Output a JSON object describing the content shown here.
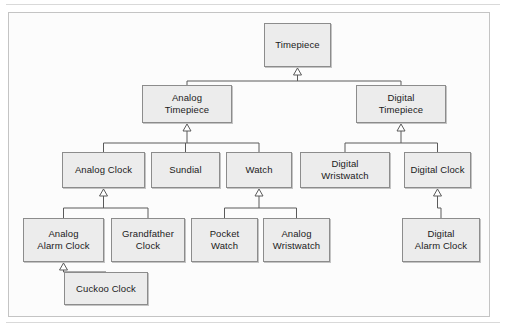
{
  "document": {
    "top_caption": "",
    "frame_label": ""
  },
  "diagram": {
    "type": "uml-class-hierarchy",
    "relationship": "generalization",
    "arrow_style": "hollow-triangle-pointing-to-parent",
    "colors": {
      "node_fill": "#ececec",
      "node_border": "#8c8c8c",
      "connector": "#5a5a5a",
      "frame_border": "#c4c4c4",
      "canvas": "#fcfcfc",
      "text": "#1b1b1b"
    },
    "nodes": [
      {
        "id": "timepiece",
        "label": "Timepiece",
        "x": 264,
        "y": 23,
        "w": 67,
        "h": 44,
        "level": 0,
        "parent": null
      },
      {
        "id": "analog-timepiece",
        "label": "Analog\nTimepiece",
        "x": 142,
        "y": 85,
        "w": 90,
        "h": 38,
        "level": 1,
        "parent": "timepiece"
      },
      {
        "id": "digital-timepiece",
        "label": "Digital\nTimepiece",
        "x": 356,
        "y": 85,
        "w": 90,
        "h": 38,
        "level": 1,
        "parent": "timepiece"
      },
      {
        "id": "analog-clock",
        "label": "Analog Clock",
        "x": 62,
        "y": 152,
        "w": 83,
        "h": 36,
        "level": 2,
        "parent": "analog-timepiece"
      },
      {
        "id": "sundial",
        "label": "Sundial",
        "x": 151,
        "y": 152,
        "w": 69,
        "h": 36,
        "level": 2,
        "parent": "analog-timepiece"
      },
      {
        "id": "watch",
        "label": "Watch",
        "x": 226,
        "y": 152,
        "w": 66,
        "h": 36,
        "level": 2,
        "parent": "analog-timepiece"
      },
      {
        "id": "digital-wristwatch",
        "label": "Digital\nWristwatch",
        "x": 300,
        "y": 152,
        "w": 90,
        "h": 36,
        "level": 2,
        "parent": "digital-timepiece"
      },
      {
        "id": "digital-clock",
        "label": "Digital Clock",
        "x": 404,
        "y": 152,
        "w": 67,
        "h": 36,
        "level": 2,
        "parent": "digital-timepiece"
      },
      {
        "id": "analog-alarm-clock",
        "label": "Analog\nAlarm Clock",
        "x": 23,
        "y": 218,
        "w": 81,
        "h": 44,
        "level": 3,
        "parent": "analog-clock"
      },
      {
        "id": "grandfather-clock",
        "label": "Grandfather\nClock",
        "x": 111,
        "y": 218,
        "w": 74,
        "h": 44,
        "level": 3,
        "parent": "analog-clock"
      },
      {
        "id": "pocket-watch",
        "label": "Pocket\nWatch",
        "x": 191,
        "y": 218,
        "w": 67,
        "h": 44,
        "level": 3,
        "parent": "watch"
      },
      {
        "id": "analog-wristwatch",
        "label": "Analog\nWristwatch",
        "x": 263,
        "y": 218,
        "w": 67,
        "h": 44,
        "level": 3,
        "parent": "watch"
      },
      {
        "id": "digital-alarm-clock",
        "label": "Digital\nAlarm Clock",
        "x": 402,
        "y": 218,
        "w": 78,
        "h": 44,
        "level": 3,
        "parent": "digital-clock"
      },
      {
        "id": "cuckoo-clock",
        "label": "Cuckoo Clock",
        "x": 64,
        "y": 272,
        "w": 84,
        "h": 33,
        "level": 4,
        "parent": "analog-alarm-clock"
      }
    ],
    "edges": [
      {
        "from": "analog-timepiece",
        "to": "timepiece"
      },
      {
        "from": "digital-timepiece",
        "to": "timepiece"
      },
      {
        "from": "analog-clock",
        "to": "analog-timepiece"
      },
      {
        "from": "sundial",
        "to": "analog-timepiece"
      },
      {
        "from": "watch",
        "to": "analog-timepiece"
      },
      {
        "from": "digital-wristwatch",
        "to": "digital-timepiece"
      },
      {
        "from": "digital-clock",
        "to": "digital-timepiece"
      },
      {
        "from": "analog-alarm-clock",
        "to": "analog-clock"
      },
      {
        "from": "grandfather-clock",
        "to": "analog-clock"
      },
      {
        "from": "pocket-watch",
        "to": "watch"
      },
      {
        "from": "analog-wristwatch",
        "to": "watch"
      },
      {
        "from": "digital-alarm-clock",
        "to": "digital-clock"
      },
      {
        "from": "cuckoo-clock",
        "to": "analog-alarm-clock"
      }
    ]
  }
}
